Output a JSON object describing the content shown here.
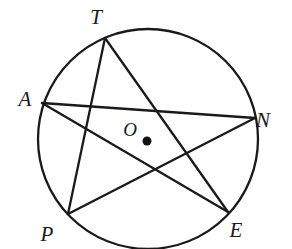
{
  "figure": {
    "type": "geometry-diagram",
    "stroke_color": "#1a1a1a",
    "background_color": "#ffffff",
    "circle": {
      "center_x": 148,
      "center_y": 139,
      "radius": 110,
      "center_dot_x": 147,
      "center_dot_y": 141,
      "center_dot_radius": 4.5
    },
    "center_point": {
      "label": "O",
      "label_x": 130,
      "label_y": 136
    },
    "vertices": [
      {
        "label": "T",
        "x": 105,
        "y": 38,
        "label_x": 96,
        "label_y": 24
      },
      {
        "label": "A",
        "x": 42,
        "y": 103,
        "label_x": 25,
        "label_y": 106
      },
      {
        "label": "N",
        "x": 255,
        "y": 118,
        "label_x": 263,
        "label_y": 127
      },
      {
        "label": "P",
        "x": 68,
        "y": 214,
        "label_x": 47,
        "label_y": 241
      },
      {
        "label": "E",
        "x": 228,
        "y": 212,
        "label_x": 236,
        "label_y": 237
      }
    ],
    "chords": [
      {
        "from": "T",
        "to": "P"
      },
      {
        "from": "P",
        "to": "N"
      },
      {
        "from": "N",
        "to": "A"
      },
      {
        "from": "A",
        "to": "E"
      },
      {
        "from": "E",
        "to": "T"
      }
    ]
  }
}
